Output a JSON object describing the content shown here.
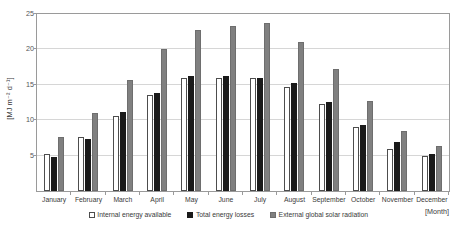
{
  "chart_data": {
    "type": "bar",
    "title": "",
    "xlabel": "[Month]",
    "ylabel": "[MJ m⁻² d⁻¹]",
    "ylim": [
      0,
      25
    ],
    "yticks": [
      0,
      5,
      10,
      15,
      20,
      25
    ],
    "ytick_labels": [
      "0",
      "5",
      "10",
      "15",
      "20",
      "25"
    ],
    "grid": true,
    "legend_position": "bottom-center",
    "categories": [
      "January",
      "February",
      "March",
      "April",
      "May",
      "June",
      "July",
      "August",
      "September",
      "October",
      "November",
      "December"
    ],
    "series": [
      {
        "name": "Internal energy available",
        "color": "#ffffff",
        "edge_color": "#4d4d4d",
        "values": [
          5.2,
          7.6,
          10.6,
          13.6,
          15.9,
          15.9,
          15.9,
          14.7,
          12.3,
          9.0,
          6.0,
          4.9
        ]
      },
      {
        "name": "Total energy losses",
        "color": "#1a1a1a",
        "edge_color": "#1a1a1a",
        "values": [
          4.8,
          7.3,
          11.1,
          13.9,
          16.3,
          16.2,
          16.0,
          15.3,
          12.6,
          9.3,
          6.9,
          5.2
        ]
      },
      {
        "name": "External global solar radiation",
        "color": "#808080",
        "edge_color": "#6e6e6e",
        "values": [
          7.6,
          11.0,
          15.7,
          20.1,
          22.7,
          23.3,
          23.7,
          21.1,
          17.2,
          12.7,
          8.5,
          6.4
        ]
      }
    ]
  },
  "axes": {
    "y_title": "[MJ m⁻² d⁻¹]",
    "x_title": "[Month]"
  },
  "legend": {
    "items": [
      {
        "label": "Internal energy available",
        "swatch": "internal"
      },
      {
        "label": "Total energy losses",
        "swatch": "losses"
      },
      {
        "label": "External global solar radiation",
        "swatch": "solar"
      }
    ]
  }
}
